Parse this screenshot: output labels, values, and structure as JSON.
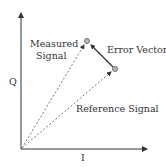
{
  "diagram": {
    "type": "iq-vector-diagram",
    "axes": {
      "x_label": "I",
      "y_label": "Q"
    },
    "labels": {
      "measured_line1": "Measured",
      "measured_line2": "Signal",
      "error_vector": "Error Vector",
      "reference": "Reference Signal"
    },
    "points": {
      "origin": [
        21,
        149
      ],
      "measured": [
        87,
        41
      ],
      "reference": [
        115,
        69
      ]
    },
    "colors": {
      "axis": "#333333",
      "dashed": "#777777",
      "point_fill": "#bbbbbb",
      "text": "#333333"
    }
  }
}
